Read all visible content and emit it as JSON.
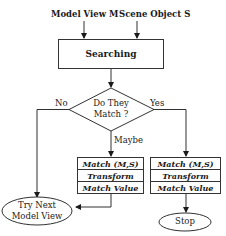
{
  "inputs": {
    "model_view": "Model View M",
    "scene_object": "Scene Object S"
  },
  "process": {
    "searching": "Searching"
  },
  "decision": {
    "line1": "Do They",
    "line2": "Match ?",
    "no_label": "No",
    "yes_label": "Yes",
    "maybe_label": "Maybe"
  },
  "maybe_box": {
    "rows": [
      "Match (M,S)",
      "Transform",
      "Match Value"
    ]
  },
  "yes_box": {
    "rows": [
      "Match (M,S)",
      "Transform",
      "Match Value"
    ]
  },
  "terminals": {
    "try_next_line1": "Try Next",
    "try_next_line2": "Model View",
    "stop": "Stop"
  }
}
